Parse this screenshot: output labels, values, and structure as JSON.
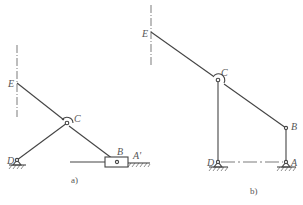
{
  "figures": [
    {
      "id": "a",
      "caption": "a)",
      "points": {
        "E": {
          "label": "E"
        },
        "C": {
          "label": "C"
        },
        "D": {
          "label": "D"
        },
        "B": {
          "label": "B"
        },
        "A_prime": {
          "label": "A'"
        }
      },
      "description": "Slider-crank mechanism: link EC-B with slider B on horizontal guide, crank DC pinned at D"
    },
    {
      "id": "b",
      "caption": "b)",
      "points": {
        "E": {
          "label": "E"
        },
        "C": {
          "label": "C"
        },
        "D": {
          "label": "D"
        },
        "B": {
          "label": "B"
        },
        "A": {
          "label": "A"
        }
      },
      "description": "Four-bar linkage: D-C vertical, A-B vertical, link E-C-B, ground pins D and A"
    }
  ],
  "colors": {
    "line": "#444444",
    "text": "#555555"
  }
}
